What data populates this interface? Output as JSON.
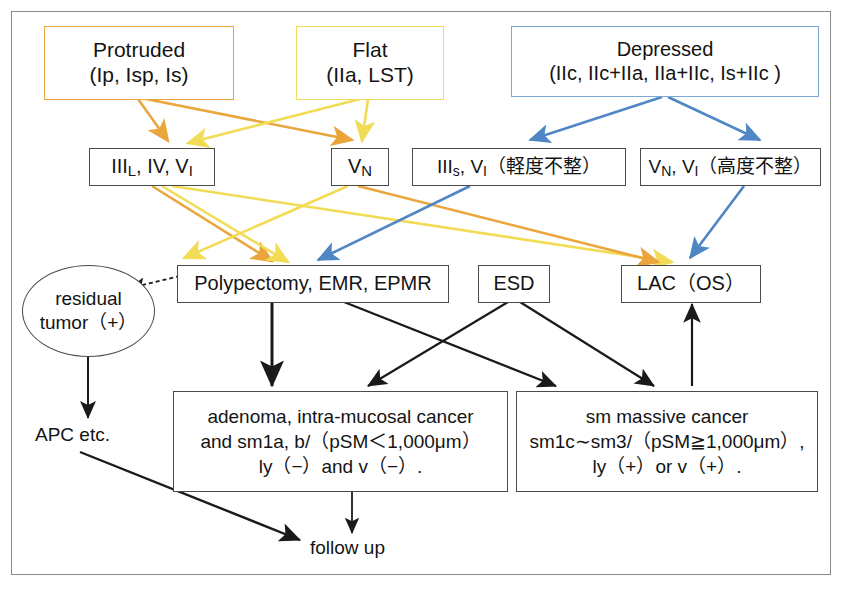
{
  "diagram": {
    "colors": {
      "orange": "#eaa53c",
      "yellow": "#f2dc55",
      "blue": "#4f86c6",
      "black": "#1a1a1a",
      "frame": "#8a8a8a",
      "box_border": "#4a4a4a",
      "background": "#ffffff"
    }
  },
  "row_morphology": {
    "protruded": {
      "line1": "Protruded",
      "line2": "(Ip, Isp, Is)"
    },
    "flat": {
      "line1": "Flat",
      "line2": "(IIa, LST)"
    },
    "depressed": {
      "line1": "Depressed",
      "line2": "(IIc, IIc+IIa, IIa+IIc, Is+IIc )"
    }
  },
  "row_pit_pattern": {
    "pit_left": {
      "main": "III",
      "sub": "L",
      "rest": ", IV, V",
      "sub2": "I"
    },
    "pit_left_text": "IIIL, IV, VI",
    "pit_vn": {
      "main": "V",
      "sub": "N"
    },
    "pit_vn_text": "VN",
    "pit_mild": {
      "main": "III",
      "sub": "s",
      "mid": ", V",
      "sub2": "I",
      "tail": "（軽度不整）"
    },
    "pit_mild_text": "IIIs, VI（軽度不整）",
    "pit_severe": {
      "main": "V",
      "sub": "N",
      "mid": ", V",
      "sub2": "I",
      "tail": "（高度不整）"
    },
    "pit_severe_text": "VN, VI（高度不整）"
  },
  "row_treatment": {
    "polypectomy": "Polypectomy, EMR, EPMR",
    "esd": "ESD",
    "lac": "LAC（OS）"
  },
  "residual": {
    "line1": "residual",
    "line2": "tumor（+）"
  },
  "apc": "APC etc.",
  "outcome_left": {
    "line1": "adenoma, intra-mucosal cancer",
    "line2": "and sm1a, b/（pSM＜1,000μm）",
    "line3": "ly（−）and v（−）."
  },
  "outcome_right": {
    "line1": "sm massive cancer",
    "line2": "sm1c∼sm3/（pSM≧1,000μm）,",
    "line3": "ly（+）or v（+）."
  },
  "follow_up": "follow up"
}
